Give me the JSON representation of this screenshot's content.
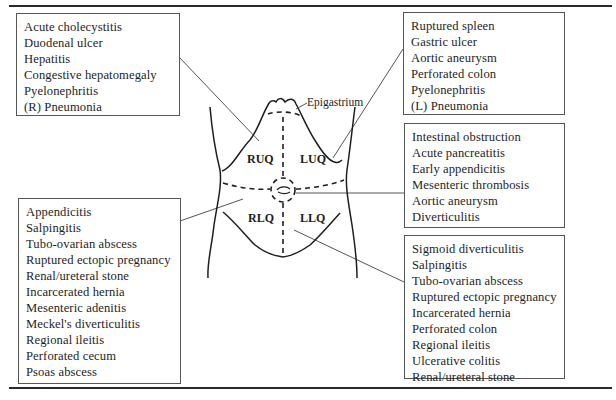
{
  "diagram": {
    "type": "abdominal quadrant differential diagnosis",
    "regions": {
      "epigastrium": "Epigastrium",
      "ruq": "RUQ",
      "luq": "LUQ",
      "rlq": "RLQ",
      "llq": "LLQ"
    },
    "boxes": {
      "ruq": {
        "items": [
          "Acute cholecystitis",
          "Duodenal ulcer",
          "Hepatitis",
          "Congestive hepatomegaly",
          "Pyelonephritis",
          "(R) Pneumonia"
        ]
      },
      "luq": {
        "items": [
          "Ruptured spleen",
          "Gastric ulcer",
          "Aortic aneurysm",
          "Perforated colon",
          "Pyelonephritis",
          "(L) Pneumonia"
        ]
      },
      "periumbilical": {
        "items": [
          "Intestinal obstruction",
          "Acute pancreatitis",
          "Early appendicitis",
          "Mesenteric thrombosis",
          "Aortic aneurysm",
          "Diverticulitis"
        ]
      },
      "rlq": {
        "items": [
          "Appendicitis",
          "Salpingitis",
          "Tubo-ovarian abscess",
          "Ruptured ectopic pregnancy",
          "Renal/ureteral stone",
          "Incarcerated hernia",
          "Mesenteric adenitis",
          "Meckel's diverticulitis",
          "Regional ileitis",
          "Perforated cecum",
          "Psoas abscess"
        ]
      },
      "llq": {
        "items": [
          "Sigmoid diverticulitis",
          "Salpingitis",
          "Tubo-ovarian abscess",
          "Ruptured ectopic pregnancy",
          "Incarcerated hernia",
          "Perforated colon",
          "Regional ileitis",
          "Ulcerative colitis",
          "Renal/ureteral stone"
        ]
      }
    },
    "colors": {
      "line": "#1e1e1e",
      "box_border": "#555555",
      "background": "#ffffff"
    }
  }
}
